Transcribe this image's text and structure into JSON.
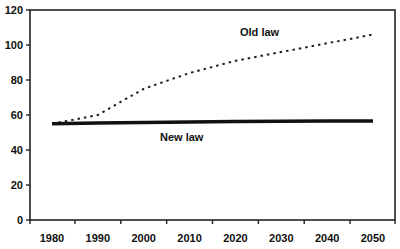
{
  "chart_data": {
    "type": "line",
    "title": "",
    "xlabel": "",
    "ylabel": "",
    "categories": [
      "1980",
      "1990",
      "2000",
      "2010",
      "2020",
      "2030",
      "2040",
      "2050"
    ],
    "ylim": [
      0,
      120
    ],
    "yticks": [
      0,
      20,
      40,
      60,
      80,
      100,
      120
    ],
    "grid": false,
    "legend": "none (inline series labels)",
    "series": [
      {
        "name": "Old law",
        "style": "dotted",
        "color": "#222222",
        "values": [
          55,
          60,
          75,
          84,
          91,
          96,
          101,
          106
        ]
      },
      {
        "name": "New law",
        "style": "solid-thick",
        "color": "#111111",
        "values": [
          55,
          55.5,
          55.8,
          56,
          56.2,
          56.4,
          56.5,
          56.6
        ]
      }
    ],
    "annotations": [
      {
        "text": "Old law",
        "near": "2020",
        "value": 108
      },
      {
        "text": "New law",
        "near": "2010",
        "value": 46
      }
    ]
  },
  "labels": {
    "old_law": "Old law",
    "new_law": "New law"
  }
}
